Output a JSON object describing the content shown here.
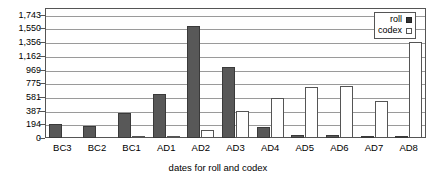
{
  "chart_data": {
    "type": "bar",
    "title": "",
    "subtitle": "",
    "xlabel": "dates for roll and codex",
    "ylabel": "",
    "categories": [
      "BC3",
      "BC2",
      "BC1",
      "AD1",
      "AD2",
      "AD3",
      "AD4",
      "AD5",
      "AD6",
      "AD7",
      "AD8"
    ],
    "series": [
      {
        "name": "roll",
        "color": "#585858",
        "values": [
          200,
          170,
          350,
          620,
          1590,
          1010,
          150,
          40,
          40,
          20,
          15
        ]
      },
      {
        "name": "codex",
        "color": "#ffffff",
        "values": [
          0,
          0,
          10,
          20,
          120,
          385,
          560,
          715,
          730,
          520,
          1356
        ]
      }
    ],
    "ylim": [
      0,
      1840
    ],
    "yticks": [
      0,
      194,
      387,
      581,
      775,
      969,
      1162,
      1356,
      1550,
      1743
    ],
    "ytick_labels": [
      "0",
      "194",
      "387",
      "581",
      "775",
      "969",
      "1,162",
      "1,356",
      "1,550",
      "1,743"
    ],
    "grid": true,
    "legend_position": "top-right",
    "legend_entries": [
      {
        "label": "roll",
        "swatch": "filled-square-icon"
      },
      {
        "label": "codex",
        "swatch": "open-square-icon"
      }
    ]
  }
}
